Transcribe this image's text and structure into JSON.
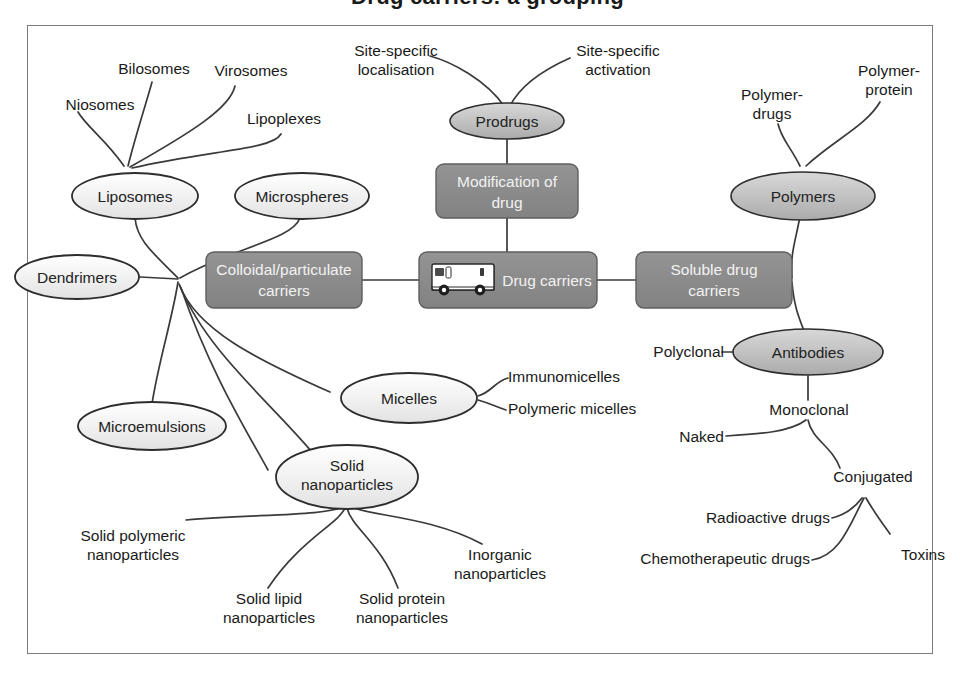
{
  "title": "Drug carriers: a grouping",
  "colors": {
    "frame_border": "#7b7b7b",
    "line": "#3a3a3a",
    "box_fill": "#8a8a8a",
    "box_text": "#f2f2f2",
    "ellipse_light_fill": "#f3f3f3",
    "ellipse_dark_fill": "#c0c0c0",
    "text": "#1a1a1a",
    "van_body": "#ffffff"
  },
  "central": {
    "drug_carriers": "Drug carriers",
    "van_icon": "delivery-van-icon"
  },
  "boxes": [
    {
      "id": "colloidal",
      "lines": [
        "Colloidal/particulate",
        "carriers"
      ]
    },
    {
      "id": "modification",
      "lines": [
        "Modification of",
        "drug"
      ]
    },
    {
      "id": "drug_carriers",
      "lines": [
        "Drug carriers"
      ]
    },
    {
      "id": "soluble",
      "lines": [
        "Soluble drug",
        "carriers"
      ]
    }
  ],
  "ellipses": [
    {
      "id": "liposomes",
      "lines": [
        "Liposomes"
      ],
      "shade": "light"
    },
    {
      "id": "microspheres",
      "lines": [
        "Microspheres"
      ],
      "shade": "light"
    },
    {
      "id": "dendrimers",
      "lines": [
        "Dendrimers"
      ],
      "shade": "light"
    },
    {
      "id": "microemulsions",
      "lines": [
        "Microemulsions"
      ],
      "shade": "light"
    },
    {
      "id": "micelles",
      "lines": [
        "Micelles"
      ],
      "shade": "light"
    },
    {
      "id": "solid_nanoparticles",
      "lines": [
        "Solid",
        "nanoparticles"
      ],
      "shade": "light"
    },
    {
      "id": "prodrugs",
      "lines": [
        "Prodrugs"
      ],
      "shade": "dark"
    },
    {
      "id": "polymers",
      "lines": [
        "Polymers"
      ],
      "shade": "dark"
    },
    {
      "id": "antibodies",
      "lines": [
        "Antibodies"
      ],
      "shade": "dark"
    }
  ],
  "leaf_labels": [
    {
      "id": "niosomes",
      "lines": [
        "Niosomes"
      ]
    },
    {
      "id": "bilosomes",
      "lines": [
        "Bilosomes"
      ]
    },
    {
      "id": "virosomes",
      "lines": [
        "Virosomes"
      ]
    },
    {
      "id": "lipoplexes",
      "lines": [
        "Lipoplexes"
      ]
    },
    {
      "id": "site_specific_localisation",
      "lines": [
        "Site-specific",
        "localisation"
      ]
    },
    {
      "id": "site_specific_activation",
      "lines": [
        "Site-specific",
        "activation"
      ]
    },
    {
      "id": "polymer_drugs",
      "lines": [
        "Polymer-",
        "drugs"
      ]
    },
    {
      "id": "polymer_protein",
      "lines": [
        "Polymer-",
        "protein"
      ]
    },
    {
      "id": "polyclonal",
      "lines": [
        "Polyclonal"
      ]
    },
    {
      "id": "monoclonal",
      "lines": [
        "Monoclonal"
      ]
    },
    {
      "id": "naked",
      "lines": [
        "Naked"
      ]
    },
    {
      "id": "conjugated",
      "lines": [
        "Conjugated"
      ]
    },
    {
      "id": "radioactive_drugs",
      "lines": [
        "Radioactive drugs"
      ]
    },
    {
      "id": "chemotherapeutic_drugs",
      "lines": [
        "Chemotherapeutic drugs"
      ]
    },
    {
      "id": "toxins",
      "lines": [
        "Toxins"
      ]
    },
    {
      "id": "immunomicelles",
      "lines": [
        "Immunomicelles"
      ]
    },
    {
      "id": "polymeric_micelles",
      "lines": [
        "Polymeric micelles"
      ]
    },
    {
      "id": "solid_polymeric_nanoparticles",
      "lines": [
        "Solid polymeric",
        "nanoparticles"
      ]
    },
    {
      "id": "solid_lipid_nanoparticles",
      "lines": [
        "Solid lipid",
        "nanoparticles"
      ]
    },
    {
      "id": "solid_protein_nanoparticles",
      "lines": [
        "Solid protein",
        "nanoparticles"
      ]
    },
    {
      "id": "inorganic_nanoparticles",
      "lines": [
        "Inorganic",
        "nanoparticles"
      ]
    }
  ],
  "text": {
    "liposomes": "Liposomes",
    "microspheres": "Microspheres",
    "dendrimers": "Dendrimers",
    "microemulsions": "Microemulsions",
    "micelles": "Micelles",
    "solid_nanoparticles_l1": "Solid",
    "solid_nanoparticles_l2": "nanoparticles",
    "prodrugs": "Prodrugs",
    "polymers": "Polymers",
    "antibodies": "Antibodies",
    "colloidal_l1": "Colloidal/particulate",
    "colloidal_l2": "carriers",
    "modification_l1": "Modification of",
    "modification_l2": "drug",
    "drug_carriers": "Drug carriers",
    "soluble_l1": "Soluble drug",
    "soluble_l2": "carriers",
    "niosomes": "Niosomes",
    "bilosomes": "Bilosomes",
    "virosomes": "Virosomes",
    "lipoplexes": "Lipoplexes",
    "ssl_l1": "Site-specific",
    "ssl_l2": "localisation",
    "ssa_l1": "Site-specific",
    "ssa_l2": "activation",
    "pd_l1": "Polymer-",
    "pd_l2": "drugs",
    "pp_l1": "Polymer-",
    "pp_l2": "protein",
    "polyclonal": "Polyclonal",
    "monoclonal": "Monoclonal",
    "naked": "Naked",
    "conjugated": "Conjugated",
    "radioactive_drugs": "Radioactive drugs",
    "chemotherapeutic_drugs": "Chemotherapeutic drugs",
    "toxins": "Toxins",
    "immunomicelles": "Immunomicelles",
    "polymeric_micelles": "Polymeric micelles",
    "spn_l1": "Solid polymeric",
    "spn_l2": "nanoparticles",
    "sln_l1": "Solid lipid",
    "sln_l2": "nanoparticles",
    "sprn_l1": "Solid protein",
    "sprn_l2": "nanoparticles",
    "in_l1": "Inorganic",
    "in_l2": "nanoparticles"
  }
}
